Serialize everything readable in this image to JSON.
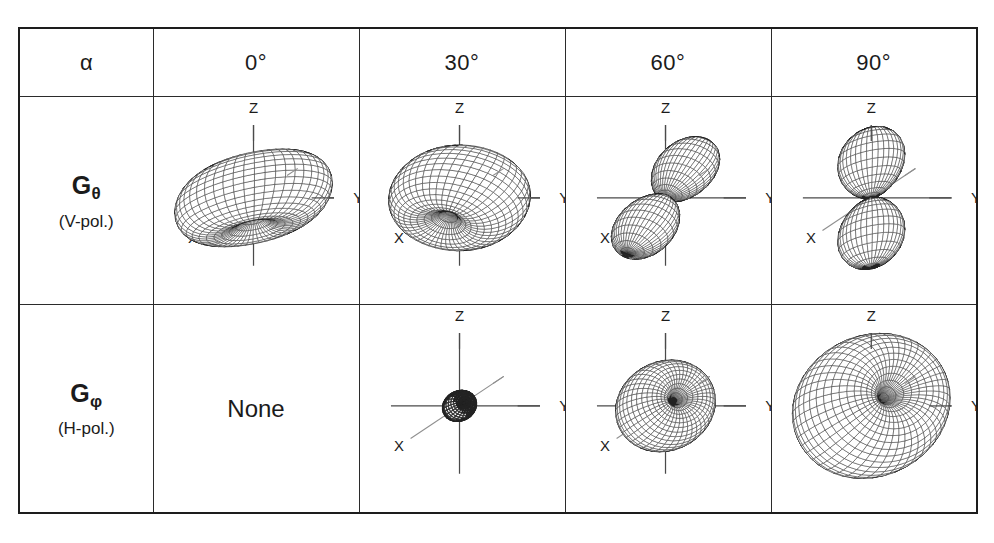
{
  "figure": {
    "type": "table-of-3d-radiation-patterns",
    "row_label_header": "α",
    "angles": [
      "0°",
      "30°",
      "60°",
      "90°"
    ],
    "axis_labels": {
      "x": "X",
      "y": "Y",
      "z": "Z"
    },
    "empty_cell_text": "None",
    "colors": {
      "border": "#1d1d1d",
      "grid": "#2b2b2b",
      "mesh": "#2f2f2f",
      "axis": "#4a4a4a",
      "text": "#1b1b1b",
      "background": "#ffffff"
    },
    "rows": [
      {
        "id": "g-theta",
        "label_main": "G",
        "label_sub": "θ",
        "label_pol": "(V-pol.)",
        "cells": [
          {
            "angle": "0°",
            "kind": "torus-horizontal",
            "has_plot": true
          },
          {
            "angle": "30°",
            "kind": "torus-tilted-30",
            "has_plot": true
          },
          {
            "angle": "60°",
            "kind": "two-lobes-tilted",
            "has_plot": true
          },
          {
            "angle": "90°",
            "kind": "two-lobes-vertical",
            "has_plot": true
          }
        ]
      },
      {
        "id": "g-phi",
        "label_main": "G",
        "label_sub": "φ",
        "label_pol": "(H-pol.)",
        "cells": [
          {
            "angle": "0°",
            "kind": "none",
            "has_plot": false
          },
          {
            "angle": "30°",
            "kind": "tiny-blob",
            "has_plot": true
          },
          {
            "angle": "60°",
            "kind": "torus-vertical-mid",
            "has_plot": true
          },
          {
            "angle": "90°",
            "kind": "torus-vertical-big",
            "has_plot": true
          }
        ]
      }
    ]
  },
  "chart_data": {
    "type": "table",
    "title": "",
    "columns": [
      "α",
      "0°",
      "30°",
      "60°",
      "90°"
    ],
    "rows": [
      {
        "label": "Gθ (V-pol.)",
        "cells": [
          "torus-horizontal",
          "torus-tilted-30",
          "two-lobes-tilted",
          "two-lobes-vertical"
        ]
      },
      {
        "label": "Gφ (H-pol.)",
        "cells": [
          "None",
          "tiny-blob",
          "torus-vertical-mid",
          "torus-vertical-big"
        ]
      }
    ],
    "axes_shown": [
      "X",
      "Y",
      "Z"
    ],
    "grid": true,
    "legend": "none"
  }
}
